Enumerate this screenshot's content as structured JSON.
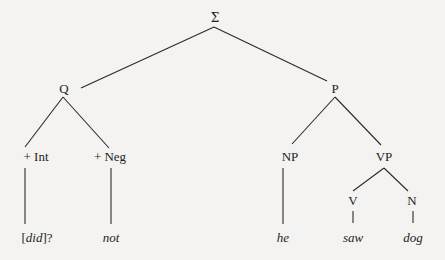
{
  "diagram": {
    "type": "syntax-tree",
    "root": {
      "label": "Σ",
      "children": [
        "Q",
        "P"
      ]
    },
    "nodes": {
      "sigma": {
        "label": "Σ"
      },
      "q": {
        "label": "Q"
      },
      "p": {
        "label": "P"
      },
      "int": {
        "label": "+ Int"
      },
      "neg": {
        "label": "+ Neg"
      },
      "np": {
        "label": "NP"
      },
      "vp": {
        "label": "VP"
      },
      "v": {
        "label": "V"
      },
      "n": {
        "label": "N"
      }
    },
    "leaves": {
      "did": {
        "prefix": "[",
        "word": "did",
        "suffix": "]?"
      },
      "not": {
        "word": "not"
      },
      "he": {
        "word": "he"
      },
      "saw": {
        "word": "saw"
      },
      "dog": {
        "word": "dog"
      }
    },
    "edges": [
      {
        "from": "Σ",
        "to": "Q"
      },
      {
        "from": "Σ",
        "to": "P"
      },
      {
        "from": "Q",
        "to": "+ Int"
      },
      {
        "from": "Q",
        "to": "+ Neg"
      },
      {
        "from": "+ Int",
        "to": "[did]?"
      },
      {
        "from": "+ Neg",
        "to": "not"
      },
      {
        "from": "P",
        "to": "NP"
      },
      {
        "from": "P",
        "to": "VP"
      },
      {
        "from": "NP",
        "to": "he"
      },
      {
        "from": "VP",
        "to": "V"
      },
      {
        "from": "VP",
        "to": "N"
      },
      {
        "from": "V",
        "to": "saw"
      },
      {
        "from": "N",
        "to": "dog"
      }
    ]
  }
}
